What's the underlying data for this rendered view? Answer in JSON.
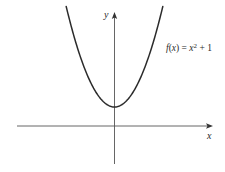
{
  "chart_data": {
    "type": "line",
    "title": "",
    "xlabel": "x",
    "ylabel": "y",
    "grid": false,
    "legend": null,
    "annotations": [
      {
        "text": "f(x) = x² + 1",
        "position": "upper-right, beside right branch of curve"
      }
    ],
    "series": [
      {
        "name": "f(x) = x^2 + 1",
        "equation": "x^2 + 1",
        "x": [
          -2.3,
          -2,
          -1.5,
          -1,
          -0.5,
          0,
          0.5,
          1,
          1.5,
          2,
          2.3
        ],
        "y": [
          6.29,
          5,
          3.25,
          2,
          1.25,
          1,
          1.25,
          2,
          3.25,
          5,
          6.29
        ]
      }
    ],
    "xlim": [
      -4.6,
      4.6
    ],
    "ylim": [
      -2,
      6.3
    ],
    "ticks": {
      "x": [],
      "y": []
    },
    "vertex": {
      "x": 0,
      "y": 1
    }
  },
  "labels": {
    "y_axis": "y",
    "x_axis": "x",
    "function_name": "f",
    "function_open": "(",
    "function_var": "x",
    "function_close": ")",
    "equals": " = ",
    "rhs_var": "x",
    "exponent": "2",
    "rhs_tail": " + 1"
  },
  "colors": {
    "curve": "#2b2b2b",
    "axes": "#555555",
    "background": "#ffffff"
  }
}
